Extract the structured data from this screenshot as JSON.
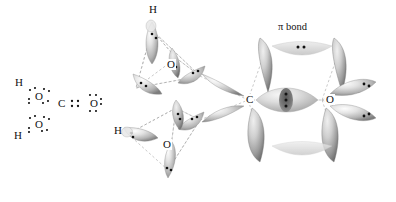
{
  "figure": {
    "background_color": "#ffffff",
    "lobe_color_light": "#f2f2f2",
    "lobe_color_mid": "#b8b8b8",
    "lobe_color_dark": "#8a8a8a",
    "dot_color": "#111111",
    "dash_color": "#9a9a9a"
  },
  "lewis": {
    "caption": "Lewis structure of carbonic acid",
    "atoms": [
      {
        "id": "h-top",
        "label": "H",
        "x": 18,
        "y": 83
      },
      {
        "id": "o-top",
        "label": "O",
        "x": 38,
        "y": 96
      },
      {
        "id": "c-center",
        "label": "C",
        "x": 60,
        "y": 106
      },
      {
        "id": "o-right",
        "label": "O",
        "x": 92,
        "y": 103
      },
      {
        "id": "o-bottom",
        "label": "O",
        "x": 38,
        "y": 124
      },
      {
        "id": "h-bottom",
        "label": "H",
        "x": 17,
        "y": 136
      }
    ],
    "bond_note": "C=O double bond drawn as two electron pairs (four dots)"
  },
  "orbital": {
    "labels": [
      {
        "id": "h-upper",
        "label": "H",
        "x": 148,
        "y": 9
      },
      {
        "id": "o-upper",
        "label": "O",
        "x": 166,
        "y": 64
      },
      {
        "id": "h-lower",
        "label": "H",
        "x": 115,
        "y": 128
      },
      {
        "id": "o-lower",
        "label": "O",
        "x": 162,
        "y": 142
      },
      {
        "id": "c-central",
        "label": "C",
        "x": 247,
        "y": 97
      },
      {
        "id": "o-right",
        "label": "O",
        "x": 327,
        "y": 97
      }
    ],
    "pi_label": {
      "text": "π bond",
      "x": 277,
      "y": 25
    }
  },
  "legend": {
    "pi_bond": "π bond",
    "element_h": "H",
    "element_c": "C",
    "element_o": "O"
  }
}
